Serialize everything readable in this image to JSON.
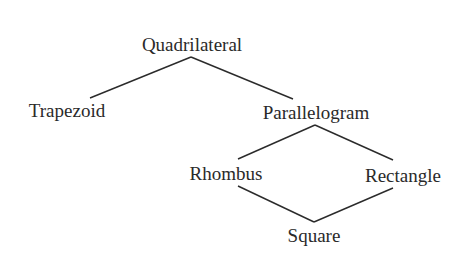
{
  "diagram": {
    "type": "hierarchy",
    "title": "",
    "text_color": "#2a2a2a",
    "line_color": "#2b2b2b",
    "nodes": [
      {
        "id": "quadrilateral",
        "label": "Quadrilateral",
        "cx": 192,
        "top": 35
      },
      {
        "id": "trapezoid",
        "label": "Trapezoid",
        "cx": 67,
        "top": 101
      },
      {
        "id": "parallelogram",
        "label": "Parallelogram",
        "cx": 316,
        "top": 103
      },
      {
        "id": "rhombus",
        "label": "Rhombus",
        "cx": 226,
        "top": 164
      },
      {
        "id": "rectangle",
        "label": "Rectangle",
        "cx": 403,
        "top": 166
      },
      {
        "id": "square",
        "label": "Square",
        "cx": 314,
        "top": 226
      }
    ],
    "edges": [
      {
        "from": "quadrilateral",
        "to": "trapezoid"
      },
      {
        "from": "quadrilateral",
        "to": "parallelogram"
      },
      {
        "from": "parallelogram",
        "to": "rhombus"
      },
      {
        "from": "parallelogram",
        "to": "rectangle"
      },
      {
        "from": "rhombus",
        "to": "square"
      },
      {
        "from": "rectangle",
        "to": "square"
      }
    ]
  }
}
